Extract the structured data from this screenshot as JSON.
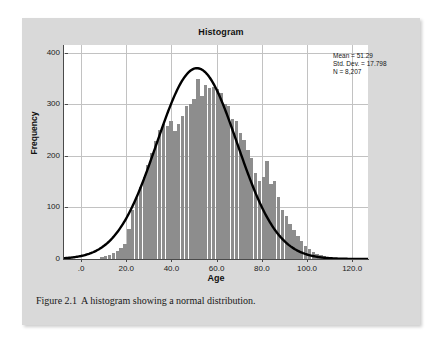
{
  "figure": {
    "caption_number": "Figure 2.1",
    "caption_text": "A histogram showing a normal distribution."
  },
  "chart_data": {
    "type": "bar",
    "title": "Histogram",
    "xlabel": "Age",
    "ylabel": "Frequency",
    "xlim": [
      -8,
      127
    ],
    "ylim": [
      0,
      415
    ],
    "xticks": [
      0,
      20,
      40,
      60,
      80,
      100,
      120
    ],
    "xtick_labels": [
      ".0",
      "20.0",
      "40.0",
      "60.0",
      "80.0",
      "100.0",
      "120.0"
    ],
    "yticks": [
      0,
      100,
      200,
      300,
      400
    ],
    "ytick_labels": [
      "0",
      "100",
      "200",
      "300",
      "400"
    ],
    "grid": true,
    "legend": "none",
    "bar_color": "#8d8d8d",
    "curve_color": "#000000",
    "bin_width": 1.7,
    "bin_starts": [
      8.5,
      10.2,
      11.9,
      13.6,
      15.3,
      17.0,
      18.7,
      20.4,
      22.1,
      23.8,
      25.5,
      27.2,
      28.9,
      30.6,
      32.3,
      34.0,
      35.7,
      37.4,
      39.1,
      40.8,
      42.5,
      44.2,
      45.9,
      47.6,
      49.3,
      51.0,
      52.7,
      54.4,
      56.1,
      57.8,
      59.5,
      61.2,
      62.9,
      64.6,
      66.3,
      68.0,
      69.7,
      71.4,
      73.1,
      74.8,
      76.5,
      78.2,
      79.9,
      81.6,
      83.3,
      85.0,
      86.7,
      88.4,
      90.1,
      91.8,
      93.5,
      95.2,
      96.9,
      98.6,
      100.3,
      102.0,
      103.7,
      105.4,
      107.1,
      108.8
    ],
    "values": [
      4,
      6,
      8,
      12,
      16,
      22,
      30,
      58,
      96,
      118,
      140,
      160,
      182,
      205,
      228,
      250,
      262,
      258,
      268,
      248,
      262,
      278,
      296,
      300,
      310,
      350,
      316,
      338,
      332,
      334,
      330,
      322,
      300,
      296,
      272,
      268,
      244,
      230,
      212,
      196,
      166,
      152,
      160,
      190,
      146,
      152,
      120,
      96,
      84,
      68,
      56,
      44,
      34,
      26,
      20,
      14,
      10,
      7,
      5,
      3
    ],
    "normal_curve": {
      "mean": 51.29,
      "std_dev": 17.798,
      "n": 8207,
      "peak_value": 370
    },
    "annotations": [
      "Mean = 51.29",
      "Std. Dev. = 17.798",
      "N = 8,207"
    ]
  },
  "stats": {
    "mean": "Mean = 51.29",
    "std_dev": "Std. Dev. = 17.798",
    "n": "N = 8,207"
  }
}
